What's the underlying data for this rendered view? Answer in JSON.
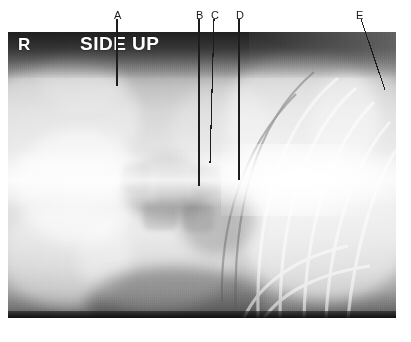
{
  "figure": {
    "type": "annotated-radiograph",
    "modality": "radiograph",
    "view_note": "lateral decubitus",
    "width": 411,
    "height": 342,
    "background_color": "#ffffff"
  },
  "plate": {
    "left": 8,
    "top": 32,
    "width": 388,
    "height": 286,
    "film_dark": "#2e2e2e",
    "film_mid": "#b9b9b9",
    "film_light": "#d6d6d6",
    "highlight": "#ffffff"
  },
  "orientation_marker": {
    "side_letter": "R",
    "side_text": "SIDE UP",
    "color": "#ffffff"
  },
  "annotations": {
    "line_color": "#1d1d1d",
    "label_color": "#1a1a1a",
    "items": [
      {
        "id": "A",
        "label": "A",
        "label_x": 114,
        "label_y": 10,
        "line_x1": 117,
        "line_y1": 19,
        "line_x2": 117,
        "line_y2": 86
      },
      {
        "id": "B",
        "label": "B",
        "label_x": 196,
        "label_y": 10,
        "line_x1": 199,
        "line_y1": 19,
        "line_x2": 199,
        "line_y2": 186
      },
      {
        "id": "C",
        "label": "C",
        "label_x": 211,
        "label_y": 10,
        "line_x1": 214,
        "line_y1": 19,
        "line_x2": 210,
        "line_y2": 163
      },
      {
        "id": "D",
        "label": "D",
        "label_x": 236,
        "label_y": 10,
        "line_x1": 239,
        "line_y1": 19,
        "line_x2": 239,
        "line_y2": 180
      },
      {
        "id": "E",
        "label": "E",
        "label_x": 356,
        "label_y": 10,
        "line_x1": 361,
        "line_y1": 19,
        "line_x2": 385,
        "line_y2": 90
      }
    ]
  }
}
